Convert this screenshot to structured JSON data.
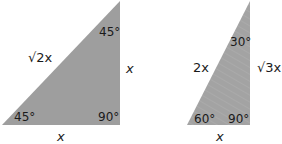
{
  "figure": {
    "fill_color": "#9e9e9e",
    "triangle_45": {
      "name": "45-45-90 triangle",
      "hypotenuse_label": "√2x",
      "vertical_leg_label": "x",
      "base_label": "x",
      "angle_top": "45°",
      "angle_bottom_left": "45°",
      "angle_right": "90°"
    },
    "triangle_30": {
      "name": "30-60-90 triangle",
      "hypotenuse_label": "2x",
      "vertical_leg_label": "√3x",
      "base_label": "x",
      "angle_top": "30°",
      "angle_bottom_left": "60°",
      "angle_right": "90°"
    }
  }
}
